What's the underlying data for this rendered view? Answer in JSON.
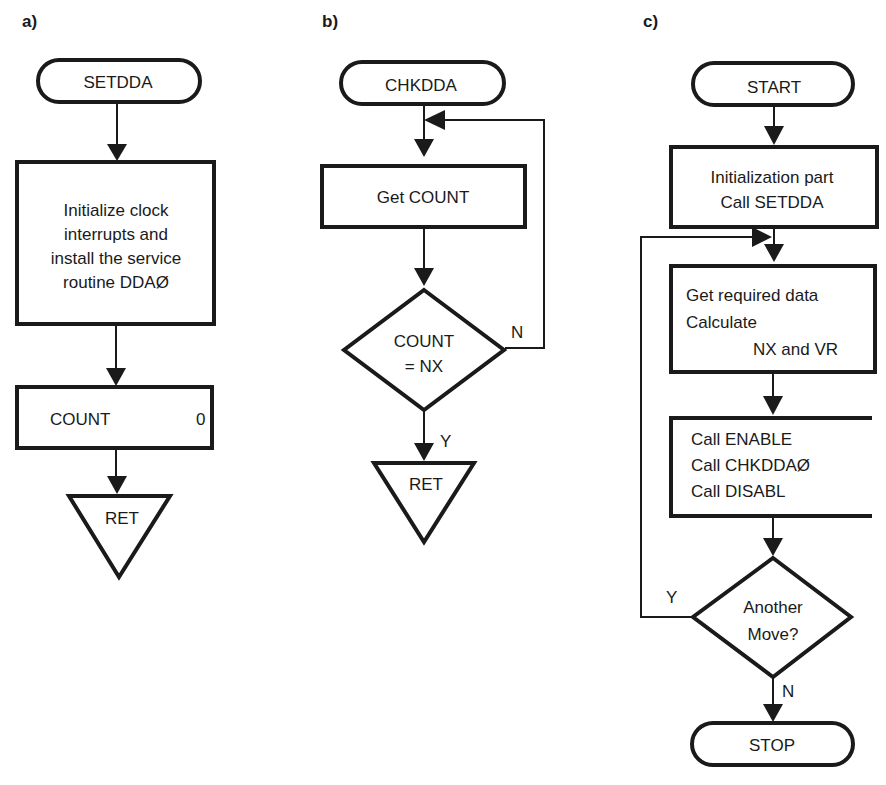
{
  "panels": {
    "a": {
      "label": "a)",
      "start": "SETDDA",
      "process": [
        "Initialize clock",
        "interrupts and",
        "install the service",
        "routine DDAØ"
      ],
      "assign": {
        "left": "COUNT",
        "right": "0"
      },
      "end": "RET"
    },
    "b": {
      "label": "b)",
      "start": "CHKDDA",
      "process": "Get  COUNT",
      "decision": [
        "COUNT",
        "= NX"
      ],
      "no_label": "N",
      "yes_label": "Y",
      "end": "RET"
    },
    "c": {
      "label": "c)",
      "start": "START",
      "init": [
        "Initialization part",
        "Call SETDDA"
      ],
      "data": [
        "Get required data",
        "Calculate",
        "NX and VR"
      ],
      "calls": [
        "Call ENABLE",
        "Call CHKDDAØ",
        "Call DISABL"
      ],
      "decision": [
        "Another",
        "Move?"
      ],
      "yes_label": "Y",
      "no_label": "N",
      "end": "STOP"
    }
  }
}
